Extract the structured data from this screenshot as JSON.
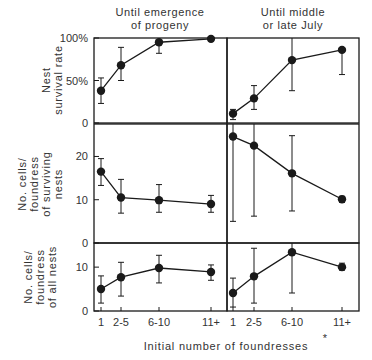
{
  "figure": {
    "column_titles": [
      {
        "line1": "Until emergence",
        "line2": "of progeny"
      },
      {
        "line1": "Until middle",
        "line2": "or late July"
      }
    ],
    "x_axis_label": "Initial number of foundresses",
    "x_categories": [
      "1",
      "2-5",
      "6-10",
      "11+"
    ],
    "footnote_mark": "*",
    "ink_color": "#1a1a1a",
    "background": "#ffffff"
  },
  "chart_data": [
    {
      "type": "line",
      "row": 0,
      "col": 0,
      "title": "Until emergence of progeny",
      "ylabel": "Nest survival rate",
      "xlabel": "Initial number of foundresses",
      "categories": [
        "1",
        "2-5",
        "6-10",
        "11+"
      ],
      "ylim": [
        0,
        100
      ],
      "yticks": [
        {
          "value": 0,
          "label": "0"
        },
        {
          "value": 50,
          "label": "50%"
        },
        {
          "value": 100,
          "label": "100%"
        }
      ],
      "values": [
        38,
        68,
        95,
        99
      ],
      "error_low": [
        23,
        50,
        82,
        99
      ],
      "error_high": [
        53,
        89,
        100,
        99
      ]
    },
    {
      "type": "line",
      "row": 0,
      "col": 1,
      "title": "Until middle or late July",
      "ylabel": "Nest survival rate",
      "xlabel": "Initial number of foundresses",
      "categories": [
        "1",
        "2-5",
        "6-10",
        "11+"
      ],
      "ylim": [
        0,
        100
      ],
      "yticks": [
        {
          "value": 0,
          "label": "0"
        },
        {
          "value": 50,
          "label": "50%"
        },
        {
          "value": 100,
          "label": "100%"
        }
      ],
      "values": [
        11,
        29,
        74,
        86
      ],
      "error_low": [
        4,
        16,
        38,
        57
      ],
      "error_high": [
        16,
        44,
        100,
        86
      ]
    },
    {
      "type": "line",
      "row": 1,
      "col": 0,
      "title": "Until emergence of progeny",
      "ylabel": "No. cells/ foundress of surviving nests",
      "xlabel": "Initial number of foundresses",
      "categories": [
        "1",
        "2-5",
        "6-10",
        "11+"
      ],
      "ylim": [
        0,
        27.5
      ],
      "yticks": [
        {
          "value": 0,
          "label": "0"
        },
        {
          "value": 10,
          "label": "10"
        },
        {
          "value": 20,
          "label": "20"
        }
      ],
      "values": [
        16.5,
        10.5,
        9.9,
        9.0
      ],
      "error_low": [
        13.3,
        6.9,
        7.1,
        7.1
      ],
      "error_high": [
        19.5,
        14.7,
        13.5,
        11.0
      ]
    },
    {
      "type": "line",
      "row": 1,
      "col": 1,
      "title": "Until middle or late July",
      "ylabel": "No. cells/ foundress of surviving nests",
      "xlabel": "Initial number of foundresses",
      "categories": [
        "1",
        "2-5",
        "6-10",
        "11+"
      ],
      "ylim": [
        0,
        27.5
      ],
      "yticks": [
        {
          "value": 0,
          "label": "0"
        },
        {
          "value": 10,
          "label": "10"
        },
        {
          "value": 20,
          "label": "20"
        }
      ],
      "values": [
        24.6,
        22.5,
        16.1,
        10.1
      ],
      "error_low": [
        5.0,
        6.2,
        7.4,
        9.4
      ],
      "error_high": [
        27.5,
        27.5,
        24.8,
        10.8
      ]
    },
    {
      "type": "line",
      "row": 2,
      "col": 0,
      "title": "Until emergence of progeny",
      "ylabel": "No. cells/ foundress of all nests",
      "xlabel": "Initial number of foundresses",
      "categories": [
        "1",
        "2-5",
        "6-10",
        "11+"
      ],
      "ylim": [
        0,
        15.5
      ],
      "yticks": [
        {
          "value": 0,
          "label": "0"
        },
        {
          "value": 10,
          "label": "10"
        }
      ],
      "values": [
        5.0,
        7.7,
        9.8,
        8.9
      ],
      "error_low": [
        1.8,
        3.4,
        6.4,
        7.0
      ],
      "error_high": [
        8.0,
        11.1,
        12.7,
        10.5
      ]
    },
    {
      "type": "line",
      "row": 2,
      "col": 1,
      "title": "Until middle or late July",
      "ylabel": "No. cells/ foundress of all nests",
      "xlabel": "Initial number of foundresses",
      "categories": [
        "1",
        "2-5",
        "6-10",
        "11+"
      ],
      "ylim": [
        0,
        15.5
      ],
      "yticks": [
        {
          "value": 0,
          "label": "0"
        },
        {
          "value": 10,
          "label": "10"
        }
      ],
      "values": [
        4.1,
        7.9,
        13.4,
        10.0
      ],
      "error_low": [
        0.9,
        1.8,
        4.1,
        9.3
      ],
      "error_high": [
        7.5,
        14.3,
        15.5,
        10.9
      ]
    }
  ],
  "row_labels": [
    {
      "lines": [
        "Nest",
        "survival  rate"
      ]
    },
    {
      "lines": [
        "No. cells/",
        "foundress",
        "of  surviving",
        "nests"
      ]
    },
    {
      "lines": [
        "No. cells/",
        "foundress",
        "of  all nests"
      ]
    }
  ]
}
